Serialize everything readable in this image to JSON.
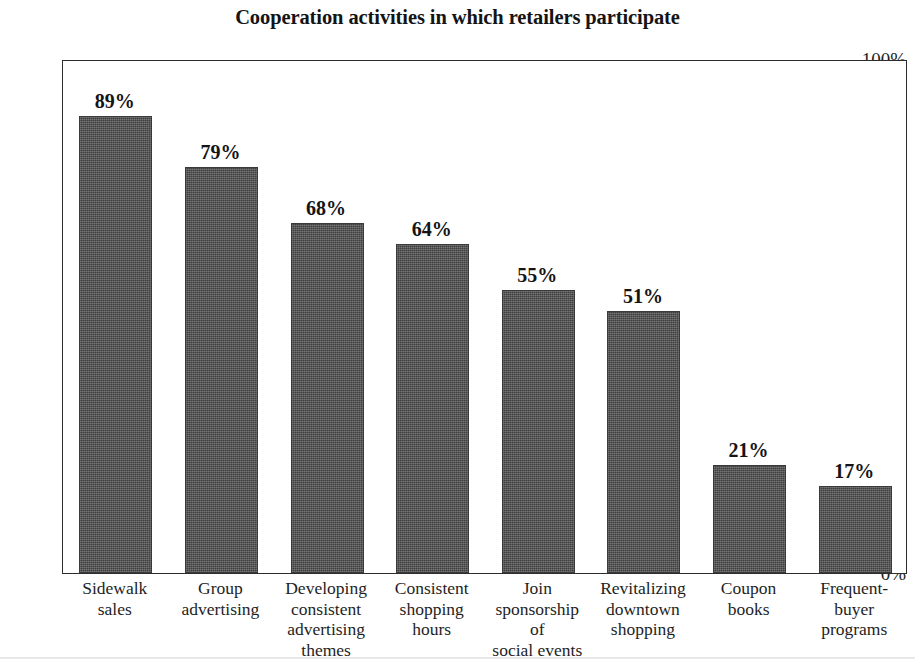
{
  "chart_data": {
    "type": "bar",
    "title": "Cooperation activities in which retailers participate",
    "xlabel": "",
    "ylabel": "",
    "ylim": [
      0,
      100
    ],
    "yticks": [
      0,
      10,
      20,
      30,
      40,
      50,
      60,
      70,
      80,
      90,
      100
    ],
    "ytick_labels": [
      "0%",
      "10%",
      "20%",
      "30%",
      "40%",
      "50%",
      "60%",
      "70%",
      "80%",
      "90%",
      "100%"
    ],
    "grid": false,
    "legend": null,
    "bar_color": "#4d4d4d",
    "categories": [
      "Sidewalk sales",
      "Group advertising",
      "Developing consistent advertising themes",
      "Consistent shopping hours",
      "Join sponsorship of social events",
      "Revitalizing downtown shopping",
      "Coupon books",
      "Frequent-buyer programs"
    ],
    "category_lines": [
      [
        "Sidewalk",
        "sales"
      ],
      [
        "Group",
        "advertising"
      ],
      [
        "Developing",
        "consistent",
        "advertising",
        "themes"
      ],
      [
        "Consistent",
        "shopping",
        "hours"
      ],
      [
        "Join",
        "sponsorship",
        "of",
        "social events"
      ],
      [
        "Revitalizing",
        "downtown",
        "shopping"
      ],
      [
        "Coupon",
        "books"
      ],
      [
        "Frequent-",
        "buyer",
        "programs"
      ]
    ],
    "values": [
      89,
      79,
      68,
      64,
      55,
      51,
      21,
      17
    ],
    "value_labels": [
      "89%",
      "79%",
      "68%",
      "64%",
      "55%",
      "51%",
      "21%",
      "17%"
    ],
    "bar_pixel_heights": [
      460,
      403,
      342,
      330,
      281,
      255,
      108,
      79
    ]
  }
}
